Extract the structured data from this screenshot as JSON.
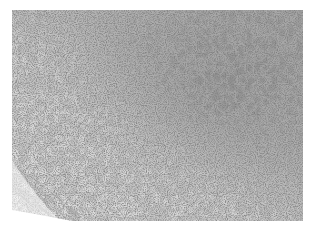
{
  "image": {
    "kind": "grayscale histology micrograph",
    "regions": [
      {
        "name": "light-large-cell-region",
        "position": "left and lower-left",
        "tone": "#d8d8d8"
      },
      {
        "name": "dense-dark-cell-region",
        "position": "upper-right and right",
        "tone": "#a9a9a9"
      },
      {
        "name": "fibrous-capsule-band",
        "position": "bottom-left edge, diagonal",
        "tone": "#8c8c8c"
      }
    ],
    "colors": {
      "background": "#ffffff",
      "nuclei": "#3a3a3a",
      "light_cytoplasm": "#dcdcdc",
      "dense_area": "#a6a6a6"
    }
  }
}
